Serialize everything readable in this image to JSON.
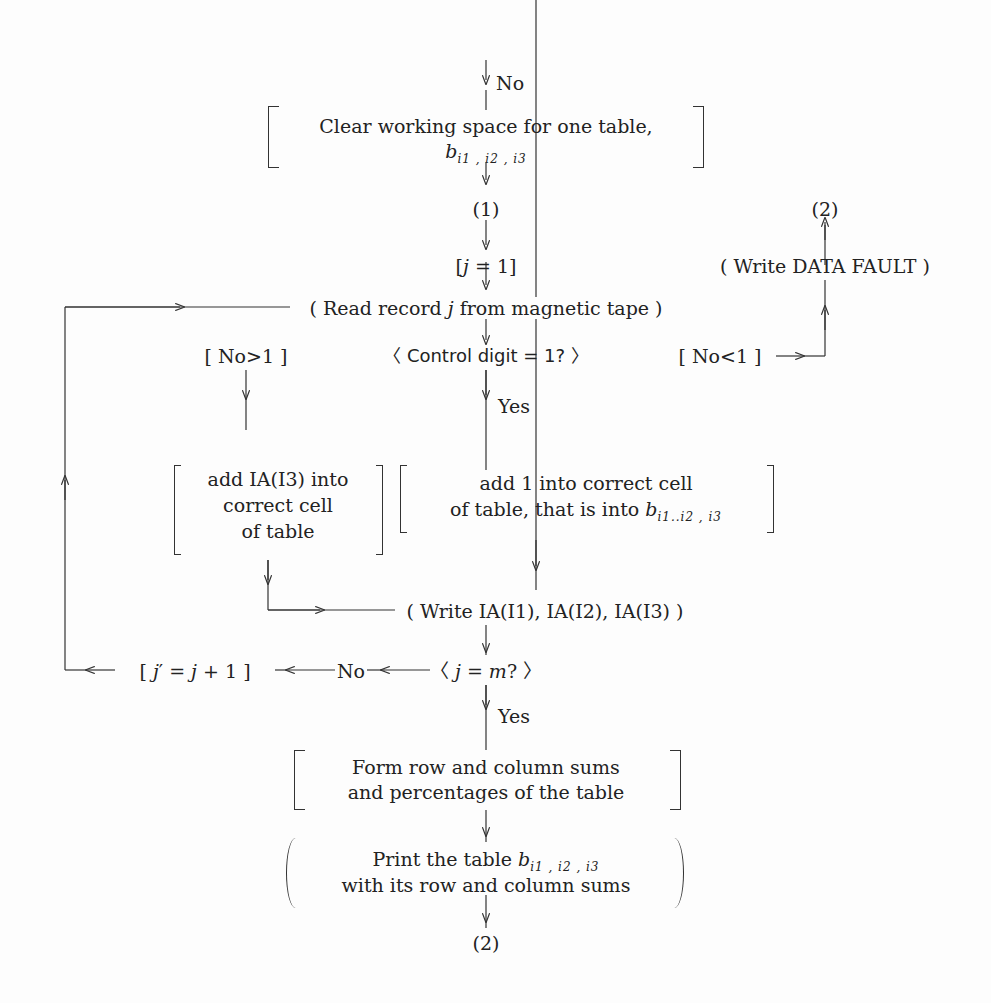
{
  "flowchart": {
    "entry_label": "No",
    "clear_box": {
      "line1": "Clear working space for one table,",
      "var": "b",
      "sub": "i1 , i2 , i3"
    },
    "connector_1": "(1)",
    "init": {
      "text_pre": "[",
      "var": "j",
      "text_post": " = 1]"
    },
    "write_fault": "( Write DATA FAULT )",
    "connector_2_top": "(2)",
    "read_record": {
      "pre": "( Read record ",
      "var": "j",
      "post": " from magnetic tape )"
    },
    "decision_control": "〈 Control digit = 1? 〉",
    "branch_gt": "[ No>1 ]",
    "branch_lt": "[ No<1 ]",
    "yes_label_1": "Yes",
    "add_ia": {
      "line1": "add IA(I3) into",
      "line2": "correct cell",
      "line3": "of table"
    },
    "add_one": {
      "line1": "add 1 into correct cell",
      "line2": "of table, that is into",
      "var": "b",
      "sub": "i1..i2 , i3"
    },
    "write_ia": "( Write IA(I1), IA(I2), IA(I3) )",
    "decision_jm": {
      "pre": "〈 ",
      "var1": "j",
      "mid": " = ",
      "var2": "m",
      "post": "? 〉"
    },
    "no_label": "No",
    "increment": {
      "pre": "[ ",
      "var1": "j",
      "mid": "′ = ",
      "var2": "j",
      "post": " + 1 ]"
    },
    "yes_label_2": "Yes",
    "form_sums": {
      "line1": "Form row and column sums",
      "line2": "and percentages of the table"
    },
    "print_table": {
      "line1": "Print the table",
      "var": "b",
      "sub": "i1 , i2 , i3",
      "line2": "with its row and column sums"
    },
    "connector_2_bottom": "(2)"
  }
}
